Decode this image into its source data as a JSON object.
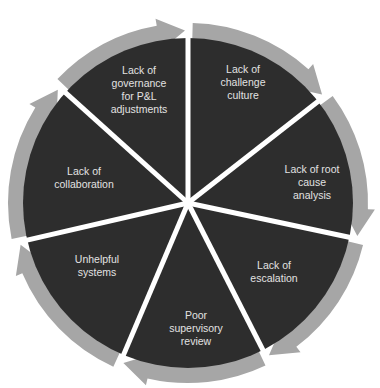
{
  "diagram": {
    "type": "cycle",
    "colors": {
      "background": "#ffffff",
      "segment_fill": "#2d2d2d",
      "ring_arrow": "#a6a6a6",
      "divider": "#ffffff",
      "label_text": "#e2e2e2"
    },
    "segments": [
      {
        "label": "Lack of\nchallenge\nculture",
        "x": 243,
        "y": 82
      },
      {
        "label": "Lack of root\ncause analysis",
        "x": 312,
        "y": 182
      },
      {
        "label": "Lack of\nescalation",
        "x": 274,
        "y": 272
      },
      {
        "label": "Poor\nsupervisory\nreview",
        "x": 196,
        "y": 328
      },
      {
        "label": "Unhelpful\nsystems",
        "x": 97,
        "y": 266
      },
      {
        "label": "Lack of\ncollaboration",
        "x": 84,
        "y": 178
      },
      {
        "label": "Lack of\ngovernance\nfor P&L\nadjustments",
        "x": 139,
        "y": 90
      }
    ]
  }
}
